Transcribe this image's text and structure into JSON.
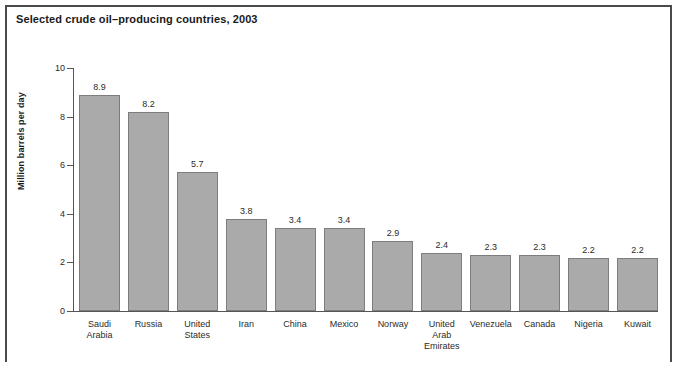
{
  "figure": {
    "title": "Selected crude oil–producing countries, 2003"
  },
  "chart_data": {
    "type": "bar",
    "title": "Selected crude oil–producing countries, 2003",
    "xlabel": "",
    "ylabel": "Million barrels per day",
    "ylim": [
      0,
      10
    ],
    "yticks": [
      "0",
      "2",
      "4",
      "6",
      "8",
      "10"
    ],
    "grid": false,
    "legend": null,
    "orientation": "vertical",
    "bar_color": "#aaaaaa",
    "bar_edge_color": "#7d7d7d",
    "categories": [
      "Saudi\nArabia",
      "Russia",
      "United\nStates",
      "Iran",
      "China",
      "Mexico",
      "Norway",
      "United\nArab\nEmirates",
      "Venezuela",
      "Canada",
      "Nigeria",
      "Kuwait"
    ],
    "values": [
      8.9,
      8.2,
      5.7,
      3.8,
      3.4,
      3.4,
      2.9,
      2.4,
      2.3,
      2.3,
      2.2,
      2.2
    ],
    "value_labels": [
      "8.9",
      "8.2",
      "5.7",
      "3.8",
      "3.4",
      "3.4",
      "2.9",
      "2.4",
      "2.3",
      "2.3",
      "2.2",
      "2.2"
    ]
  }
}
